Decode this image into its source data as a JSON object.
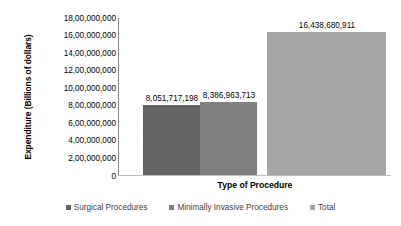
{
  "chart_data": {
    "type": "bar",
    "title": "",
    "xlabel": "Type of Procedure",
    "ylabel": "Expenditure (Billions of dollars)",
    "categories": [
      "Surgical Procedures",
      "Minimally Invasive Procedures",
      "Total"
    ],
    "values": [
      8051717198,
      8386963713,
      16438680911
    ],
    "value_labels": [
      "8,051,717,198",
      "8,386,963,713",
      "16,438,680,911"
    ],
    "ylim": [
      0,
      1800000000
    ],
    "ytick_values": [
      1800000000,
      1600000000,
      1400000000,
      1200000000,
      1000000000,
      800000000,
      600000000,
      400000000,
      200000000,
      0
    ],
    "ytick_labels": [
      "18,00,000,000",
      "16,00,000,000",
      "14,00,000,000",
      "12,00,000,000",
      "10,00,000,000",
      "8,00,000,000",
      "6,00,000,000",
      "4,00,000,000",
      "2,00,000,000",
      "0"
    ],
    "grid": false,
    "legend_position": "bottom",
    "series_colors": [
      "#636363",
      "#808080",
      "#a6a6a6"
    ],
    "legend": [
      {
        "label": "Surgical Procedures",
        "color": "#636363"
      },
      {
        "label": "Minimally Invasive Procedures",
        "color": "#808080"
      },
      {
        "label": "Total",
        "color": "#a6a6a6"
      }
    ],
    "bar_geometry": [
      {
        "left": 24,
        "width": 57,
        "height_pct": 44.7
      },
      {
        "left": 81,
        "width": 57,
        "height_pct": 46.6
      },
      {
        "left": 148,
        "width": 119,
        "height_pct": 91.3
      }
    ],
    "label_geometry": [
      {
        "left": -2,
        "width": 110,
        "bottom_pct": 44.7
      },
      {
        "left": 55,
        "width": 110,
        "bottom_pct": 46.6
      },
      {
        "left": 153,
        "width": 110,
        "bottom_pct": 91.3
      }
    ],
    "axis_color": "#868686",
    "baseline_color": "#bdbdbd"
  }
}
